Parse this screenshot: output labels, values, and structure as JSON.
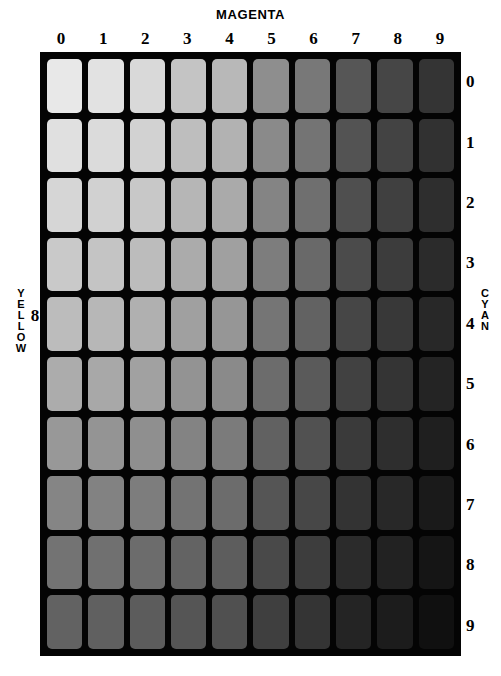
{
  "chart_data": {
    "type": "heatmap",
    "title": "MAGENTA",
    "xlabel": "MAGENTA",
    "ylabel_left": "YELLOW",
    "ylabel_right": "CYAN",
    "grid": true,
    "legend_position": "none",
    "x_categories": [
      "0",
      "1",
      "2",
      "3",
      "4",
      "5",
      "6",
      "7",
      "8",
      "9"
    ],
    "y_categories": [
      "0",
      "1",
      "2",
      "3",
      "4",
      "5",
      "6",
      "7",
      "8",
      "9"
    ],
    "fixed_yellow_level": "8",
    "background_color": "#040404",
    "page_background": "#ffffff",
    "text_color": "#000000",
    "values": [
      [
        232,
        226,
        217,
        196,
        184,
        142,
        120,
        86,
        70,
        52
      ],
      [
        224,
        219,
        210,
        190,
        178,
        138,
        116,
        83,
        67,
        49
      ],
      [
        214,
        209,
        200,
        182,
        170,
        132,
        111,
        79,
        64,
        46
      ],
      [
        201,
        196,
        188,
        171,
        160,
        125,
        105,
        75,
        60,
        43
      ],
      [
        188,
        183,
        176,
        160,
        150,
        117,
        98,
        70,
        56,
        40
      ],
      [
        172,
        168,
        161,
        147,
        138,
        108,
        90,
        65,
        52,
        36
      ],
      [
        152,
        148,
        143,
        131,
        123,
        97,
        81,
        58,
        46,
        31
      ],
      [
        133,
        130,
        125,
        115,
        108,
        85,
        71,
        51,
        40,
        26
      ],
      [
        115,
        112,
        108,
        99,
        93,
        73,
        61,
        43,
        34,
        21
      ],
      [
        98,
        96,
        92,
        85,
        80,
        63,
        52,
        36,
        28,
        16
      ]
    ]
  },
  "axes": {
    "top": {
      "title": "MAGENTA",
      "ticks": [
        "0",
        "1",
        "2",
        "3",
        "4",
        "5",
        "6",
        "7",
        "8",
        "9"
      ]
    },
    "right": {
      "title": "CYAN",
      "title_letters": [
        "C",
        "Y",
        "A",
        "N"
      ],
      "ticks": [
        "0",
        "1",
        "2",
        "3",
        "4",
        "5",
        "6",
        "7",
        "8",
        "9"
      ]
    },
    "left": {
      "title": "YELLOW",
      "title_letters": [
        "Y",
        "E",
        "L",
        "L",
        "O",
        "W"
      ],
      "level": "8"
    }
  }
}
